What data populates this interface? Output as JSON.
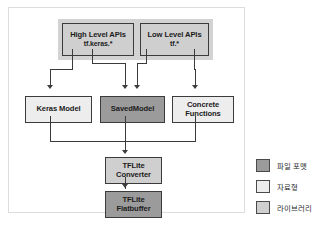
{
  "diagram": {
    "nodes": [
      {
        "id": "high_level_apis",
        "line1": "High Level APIs",
        "line2": "tf.keras.*",
        "category": "library"
      },
      {
        "id": "low_level_apis",
        "line1": "Low Level APIs",
        "line2": "tf.*",
        "category": "library"
      },
      {
        "id": "keras_model",
        "line1": "Keras Model",
        "line2": "",
        "category": "datatype"
      },
      {
        "id": "saved_model",
        "line1": "SavedModel",
        "line2": "",
        "category": "fileformat"
      },
      {
        "id": "concrete_functions",
        "line1": "Concrete",
        "line2": "Functions",
        "category": "datatype"
      },
      {
        "id": "tflite_converter",
        "line1": "TFLite",
        "line2": "Converter",
        "category": "library"
      },
      {
        "id": "tflite_flatbuffer",
        "line1": "TFLite",
        "line2": "Flatbuffer",
        "category": "fileformat"
      }
    ]
  },
  "legend": {
    "items": [
      {
        "label": "파일 포맷",
        "color": "#9b9b9b",
        "key": "fileformat"
      },
      {
        "label": "자료형",
        "color": "#ededed",
        "key": "datatype"
      },
      {
        "label": "라이브러리",
        "color": "#cfcfcf",
        "key": "library"
      }
    ]
  },
  "colors": {
    "file_format": "#9b9b9b",
    "data_type": "#ededed",
    "library": "#cfcfcf",
    "library_band": "#d3d3d3",
    "stroke": "#3b3b3b",
    "panel_border": "#dcdcdc",
    "background": "#ffffff"
  }
}
